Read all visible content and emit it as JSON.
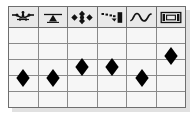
{
  "widget": {
    "title": "Icon Column Grid",
    "background_color": "#ffffff",
    "table_border_color": "#6e6e6e",
    "gridline_color": "#8a8a8a",
    "header_fill": "#e9e9e9",
    "cell_fill": "#f6f6f6",
    "marker_color": "#000000",
    "shadow_color": "#c9c9c9"
  },
  "header": {
    "columns": [
      {
        "index": 1,
        "icon": "constellation-node-icon",
        "label": ""
      },
      {
        "index": 2,
        "icon": "triangle-under-bar-icon",
        "label": ""
      },
      {
        "index": 3,
        "icon": "four-way-arrows-icon",
        "label": ""
      },
      {
        "index": 4,
        "icon": "dashed-arrow-to-block-icon",
        "label": ""
      },
      {
        "index": 5,
        "icon": "sine-wave-icon",
        "label": ""
      },
      {
        "index": 6,
        "icon": "fit-to-width-brackets-icon",
        "label": ""
      }
    ]
  },
  "grid": {
    "column_count": 6,
    "body_row_count": 5,
    "rows": [
      {
        "index": 1,
        "cells": [
          "",
          "",
          "",
          "",
          "",
          ""
        ]
      },
      {
        "index": 2,
        "cells": [
          "",
          "",
          "",
          "",
          "",
          ""
        ]
      },
      {
        "index": 3,
        "cells": [
          "",
          "",
          "",
          "",
          "",
          ""
        ]
      },
      {
        "index": 4,
        "cells": [
          "",
          "",
          "",
          "",
          "",
          ""
        ]
      },
      {
        "index": 5,
        "cells": [
          "",
          "",
          "",
          "",
          "",
          ""
        ]
      }
    ]
  },
  "chart_data": {
    "type": "scatter",
    "title": "",
    "xlabel": "",
    "ylabel": "",
    "categories": [
      "constellation-node-icon",
      "triangle-under-bar-icon",
      "four-way-arrows-icon",
      "dashed-arrow-to-block-icon",
      "sine-wave-icon",
      "fit-to-width-brackets-icon"
    ],
    "values": [
      2,
      2,
      3,
      3,
      2,
      4
    ],
    "ylim": [
      0,
      5
    ],
    "grid": true,
    "legend": false,
    "marker": "diamond",
    "points": [
      {
        "column": 1,
        "x_pct": 8.5,
        "y_pct": 70.5
      },
      {
        "column": 2,
        "x_pct": 25.2,
        "y_pct": 70.5
      },
      {
        "column": 3,
        "x_pct": 41.8,
        "y_pct": 60.0
      },
      {
        "column": 4,
        "x_pct": 58.4,
        "y_pct": 60.0
      },
      {
        "column": 5,
        "x_pct": 75.0,
        "y_pct": 70.5
      },
      {
        "column": 6,
        "x_pct": 91.6,
        "y_pct": 49.5
      }
    ]
  }
}
